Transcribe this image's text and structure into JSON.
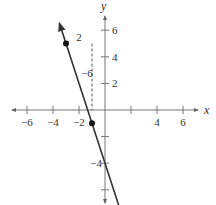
{
  "chart_data": {
    "type": "line",
    "title": "",
    "xlabel": "x",
    "ylabel": "y",
    "xlim": [
      -7,
      7
    ],
    "ylim": [
      -7,
      7
    ],
    "grid": false,
    "x_ticks": [
      -6,
      -4,
      -2,
      2,
      4,
      6
    ],
    "x_tick_labels": [
      "-6",
      "-4",
      "-2",
      "4",
      "6"
    ],
    "y_ticks": [
      -6,
      -4,
      -2,
      2,
      4,
      6
    ],
    "y_tick_labels": [
      "6",
      "4",
      "2",
      "-4"
    ],
    "series": [
      {
        "name": "line",
        "equation": "y = -3x - 4",
        "x": [
          -3.5,
          1.3
        ],
        "y": [
          6.5,
          -7.9
        ],
        "arrows": "both",
        "color": "#333333"
      }
    ],
    "points": [
      {
        "x": -3,
        "y": 5
      },
      {
        "x": -1,
        "y": -1
      }
    ],
    "dashed_guides": [
      {
        "x": -1,
        "y_from": 5,
        "y_to": 0
      }
    ],
    "annotations": [
      {
        "text": "2",
        "x": -2,
        "y": 5.5
      },
      {
        "text": "-6",
        "x": -1.4,
        "y": 2.8
      }
    ]
  }
}
